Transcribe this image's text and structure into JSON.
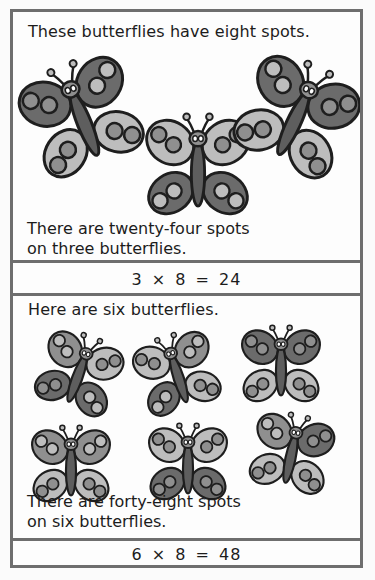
{
  "panel_1": {
    "heading": "These butterflies have eight spots.",
    "caption_line_1": "There are twenty-four spots",
    "caption_line_2": "on three butterflies.",
    "butterfly_count": 3,
    "spots_per_butterfly": 8,
    "equation": "3 × 8 = 24"
  },
  "panel_2": {
    "heading": "Here are six butterflies.",
    "caption_line_1": "There are forty-eight spots",
    "caption_line_2": "on six butterflies.",
    "butterfly_count": 6,
    "spots_per_butterfly": 8,
    "equation": "6 × 8 = 48"
  },
  "palette": {
    "outline": "#1e1e1e",
    "dark": "#6b6b6b",
    "mid": "#8f8f8f",
    "light": "#bdbdbd",
    "body": "#5e5e5e",
    "border": "#6e6e6e"
  }
}
